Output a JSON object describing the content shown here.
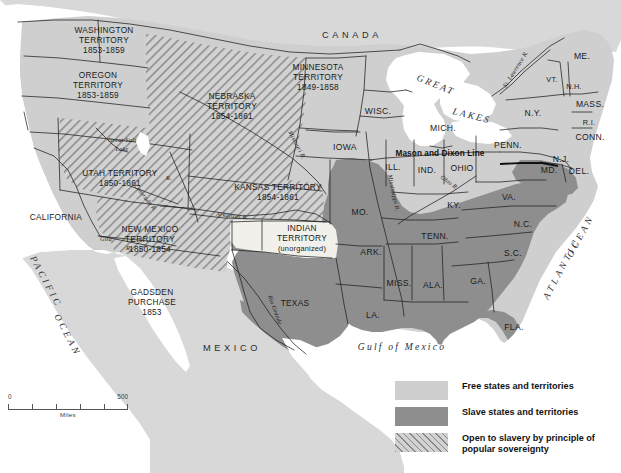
{
  "map": {
    "title": "The United States 1854 — Free and Slave States and Territories",
    "colors": {
      "free": "#cfcfcf",
      "slave": "#8e8e8e",
      "popular_sovereignty_hatch": "#8a8a8a",
      "unorganized": "#f2f0ea",
      "water": "#ffffff",
      "foreign_land": "#d8d8d8",
      "outline": "#1f1f1f"
    },
    "countries": [
      {
        "name": "CANADA",
        "x": 352,
        "y": 35
      },
      {
        "name": "MEXICO",
        "x": 232,
        "y": 348
      }
    ],
    "oceans": [
      {
        "name": "PACIFIC OCEAN",
        "line1": "PACIFIC",
        "line2": "OCEAN"
      },
      {
        "name": "ATLANTIC OCEAN",
        "line1": "ATLANTIC",
        "line2": "OCEAN"
      }
    ],
    "water_labels": [
      {
        "name": "GREAT LAKES",
        "text": "GREAT"
      },
      {
        "name": "GREAT LAKES",
        "text": "LAKES"
      },
      {
        "name": "Gulf of Mexico",
        "text": "Gulf of Mexico"
      }
    ],
    "lakes": [
      {
        "line1": "Great Salt",
        "line2": "Lake",
        "x": 122,
        "y": 143
      }
    ],
    "rivers": [
      {
        "label": "Missouri R.",
        "id": "missouri"
      },
      {
        "label": "Mississippi R.",
        "id": "mississippi"
      },
      {
        "label": "Ohio R.",
        "id": "ohio"
      },
      {
        "label": "Arkansas R.",
        "id": "arkansas"
      },
      {
        "label": "Colorado R.",
        "id": "colorado"
      },
      {
        "label": "Rio Grande",
        "id": "rio-grande"
      },
      {
        "label": "St. Lawrence R.",
        "id": "st-lawrence"
      },
      {
        "label": "Gila",
        "id": "gila"
      },
      {
        "label": "R.",
        "id": "gila-r"
      },
      {
        "label": "R.",
        "id": "colorado-r-abbrev"
      }
    ],
    "annotations": [
      {
        "name": "mason-and-dixon-line",
        "text": "Mason and Dixon Line",
        "x": 383,
        "y": 153
      }
    ],
    "territories": [
      {
        "name": "WASHINGTON TERRITORY",
        "lines": [
          "WASHINGTON",
          "TERRITORY",
          "1853-1859"
        ],
        "category": "free",
        "x": 104,
        "y": 36
      },
      {
        "name": "OREGON TERRITORY",
        "lines": [
          "OREGON",
          "TERRITORY",
          "1853-1859"
        ],
        "category": "free",
        "x": 98,
        "y": 80
      },
      {
        "name": "MINNESOTA TERRITORY",
        "lines": [
          "MINNESOTA",
          "TERRITORY",
          "1849-1858"
        ],
        "category": "free",
        "x": 316,
        "y": 65
      },
      {
        "name": "NEBRASKA TERRITORY",
        "lines": [
          "NEBRASKA",
          "TERRITORY",
          "1854-1861"
        ],
        "category": "popular_sovereignty",
        "x": 232,
        "y": 97
      },
      {
        "name": "UTAH TERRITORY",
        "lines": [
          "UTAH TERRITORY",
          "1850-1861"
        ],
        "category": "popular_sovereignty",
        "x": 118,
        "y": 176
      },
      {
        "name": "KANSAS TERRITORY",
        "lines": [
          "KANSAS TERRITORY",
          "1854-1861"
        ],
        "category": "popular_sovereignty",
        "x": 276,
        "y": 190
      },
      {
        "name": "NEW MEXICO TERRITORY",
        "lines": [
          "NEW MEXICO",
          "TERRITORY",
          "1850-1854"
        ],
        "category": "popular_sovereignty",
        "x": 148,
        "y": 236
      },
      {
        "name": "INDIAN TERRITORY",
        "lines": [
          "INDIAN",
          "TERRITORY",
          "(unorganized)"
        ],
        "category": "unorganized",
        "x": 300,
        "y": 233
      },
      {
        "name": "GADSDEN PURCHASE",
        "lines": [
          "GADSDEN",
          "PURCHASE",
          "1853"
        ],
        "category": "popular_sovereignty",
        "x": 151,
        "y": 298
      }
    ],
    "states": [
      {
        "label": "WISC.",
        "category": "free",
        "x": 378,
        "y": 111
      },
      {
        "label": "MICH.",
        "category": "free",
        "x": 443,
        "y": 128
      },
      {
        "label": "IOWA",
        "category": "free",
        "x": 345,
        "y": 147
      },
      {
        "label": "ILL.",
        "category": "free",
        "x": 391,
        "y": 167
      },
      {
        "label": "IND.",
        "category": "free",
        "x": 427,
        "y": 170
      },
      {
        "label": "OHIO",
        "category": "free",
        "x": 462,
        "y": 168
      },
      {
        "label": "PENN.",
        "category": "free",
        "x": 506,
        "y": 145
      },
      {
        "label": "N.Y.",
        "category": "free",
        "x": 533,
        "y": 113
      },
      {
        "label": "VT.",
        "category": "free",
        "x": 552,
        "y": 79
      },
      {
        "label": "N.H.",
        "category": "free",
        "x": 573,
        "y": 86
      },
      {
        "label": "ME.",
        "category": "free",
        "x": 581,
        "y": 56
      },
      {
        "label": "MASS.",
        "category": "free",
        "x": 589,
        "y": 104
      },
      {
        "label": "R.I.",
        "category": "free",
        "x": 589,
        "y": 122
      },
      {
        "label": "CONN.",
        "category": "free",
        "x": 589,
        "y": 137
      },
      {
        "label": "N.J.",
        "category": "free",
        "x": 560,
        "y": 159
      },
      {
        "label": "DEL.",
        "category": "slave",
        "x": 578,
        "y": 171
      },
      {
        "label": "MD.",
        "category": "slave",
        "x": 549,
        "y": 170
      },
      {
        "label": "VA.",
        "category": "slave",
        "x": 508,
        "y": 197
      },
      {
        "label": "KY.",
        "category": "slave",
        "x": 453,
        "y": 205
      },
      {
        "label": "MO.",
        "category": "slave",
        "x": 360,
        "y": 212
      },
      {
        "label": "TENN.",
        "category": "slave",
        "x": 434,
        "y": 236
      },
      {
        "label": "N.C.",
        "category": "slave",
        "x": 522,
        "y": 224
      },
      {
        "label": "ARK.",
        "category": "slave",
        "x": 370,
        "y": 252
      },
      {
        "label": "S.C.",
        "category": "slave",
        "x": 512,
        "y": 253
      },
      {
        "label": "MISS.",
        "category": "slave",
        "x": 398,
        "y": 283
      },
      {
        "label": "ALA.",
        "category": "slave",
        "x": 432,
        "y": 285
      },
      {
        "label": "GA.",
        "category": "slave",
        "x": 477,
        "y": 281
      },
      {
        "label": "LA.",
        "category": "slave",
        "x": 372,
        "y": 315
      },
      {
        "label": "FLA.",
        "category": "slave",
        "x": 513,
        "y": 327
      },
      {
        "label": "TEXAS",
        "category": "slave",
        "x": 294,
        "y": 303
      },
      {
        "label": "CALIFORNIA",
        "category": "free",
        "x": 54,
        "y": 217
      }
    ]
  },
  "legend": {
    "title": "Legend",
    "items": [
      {
        "swatch": "free",
        "label": "Free states and territories"
      },
      {
        "swatch": "slave",
        "label": "Slave states and territories"
      },
      {
        "swatch": "popular_sovereignty",
        "label": "Open to slavery by principle of\npopular sovereignty",
        "line1": "Open to slavery by principle of",
        "line2": "popular sovereignty"
      }
    ]
  },
  "scale": {
    "min": "0",
    "max": "500",
    "units": "Miles"
  }
}
